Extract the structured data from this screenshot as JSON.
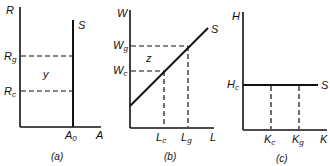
{
  "panels": [
    {
      "caption": "(a)",
      "y_axis_label": "R",
      "x_axis_label": "A",
      "curve_label": "S",
      "y_ticks": [
        {
          "main": "R",
          "sub": "g"
        },
        {
          "main": "R",
          "sub": "c"
        }
      ],
      "x_ticks": [
        {
          "main": "A",
          "sub": "0"
        }
      ],
      "area_label": "y"
    },
    {
      "caption": "(b)",
      "y_axis_label": "W",
      "x_axis_label": "L",
      "curve_label": "S",
      "y_ticks": [
        {
          "main": "W",
          "sub": "g"
        },
        {
          "main": "W",
          "sub": "c"
        }
      ],
      "x_ticks": [
        {
          "main": "L",
          "sub": "c"
        },
        {
          "main": "L",
          "sub": "g"
        }
      ],
      "area_label": "z"
    },
    {
      "caption": "(c)",
      "y_axis_label": "H",
      "x_axis_label": "K",
      "curve_label": "S",
      "y_ticks": [
        {
          "main": "H",
          "sub": "c"
        }
      ],
      "x_ticks": [
        {
          "main": "K",
          "sub": "c"
        },
        {
          "main": "K",
          "sub": "g"
        }
      ]
    }
  ]
}
